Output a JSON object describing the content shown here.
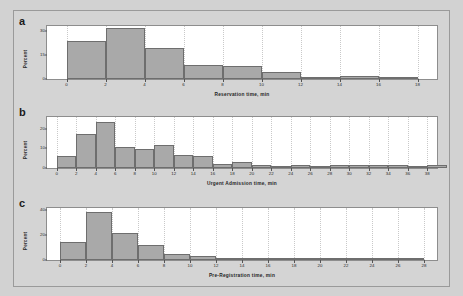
{
  "figure": {
    "background_color": "#d2d2d2",
    "panel_background": "#ffffff",
    "bar_fill_color": "#a9a9a9",
    "bar_edge_color": "#6e6e6e",
    "grid_color": "#c9c9c9"
  },
  "chart_data": [
    {
      "type": "bar",
      "panel_letter": "a",
      "title": "",
      "xlabel": "Reservation time, min",
      "ylabel": "Percent",
      "xlim": [
        -1,
        19
      ],
      "ylim": [
        0,
        33
      ],
      "xticks": [
        0,
        2,
        4,
        6,
        8,
        10,
        12,
        14,
        16,
        18
      ],
      "yticks": [
        0,
        15,
        30
      ],
      "grid": true,
      "legend": "none",
      "bin_width": 2,
      "bin_starts": [
        0,
        2,
        4,
        6,
        8,
        10,
        12,
        14,
        16
      ],
      "categories": [
        "0-2",
        "2-4",
        "4-6",
        "6-8",
        "8-10",
        "10-12",
        "12-14",
        "14-16",
        "16-18"
      ],
      "values": [
        23.5,
        31.5,
        19.5,
        8.5,
        8.0,
        4.5,
        0.0,
        2.0,
        0.0
      ]
    },
    {
      "type": "bar",
      "panel_letter": "b",
      "title": "",
      "xlabel": "Urgent Admission time, min",
      "ylabel": "Percent",
      "xlim": [
        -1,
        39
      ],
      "ylim": [
        0,
        26
      ],
      "xticks": [
        0,
        2,
        4,
        6,
        8,
        10,
        12,
        14,
        16,
        18,
        20,
        22,
        24,
        26,
        28,
        30,
        32,
        34,
        36,
        38
      ],
      "yticks": [
        0,
        10,
        20
      ],
      "grid": true,
      "legend": "none",
      "bin_width": 2,
      "bin_starts": [
        0,
        2,
        4,
        6,
        8,
        10,
        12,
        14,
        16,
        18,
        20,
        22,
        24,
        26,
        28,
        30,
        32,
        34,
        36,
        38
      ],
      "categories": [
        "0-2",
        "2-4",
        "4-6",
        "6-8",
        "8-10",
        "10-12",
        "12-14",
        "14-16",
        "16-18",
        "18-20",
        "20-22",
        "22-24",
        "24-26",
        "26-28",
        "28-30",
        "30-32",
        "32-34",
        "34-36",
        "36-38",
        "38-40"
      ],
      "values": [
        6.0,
        17.5,
        23.5,
        10.5,
        9.5,
        11.5,
        6.5,
        6.0,
        2.0,
        3.0,
        1.5,
        0.0,
        1.5,
        0.0,
        1.5,
        1.5,
        1.5,
        1.5,
        0.0,
        1.5
      ]
    },
    {
      "type": "bar",
      "panel_letter": "c",
      "title": "",
      "xlabel": "Pre-Registration time, min",
      "ylabel": "Percent",
      "xlim": [
        -1,
        29
      ],
      "ylim": [
        0,
        42
      ],
      "xticks": [
        0,
        2,
        4,
        6,
        8,
        10,
        12,
        14,
        16,
        18,
        20,
        22,
        24,
        26,
        28
      ],
      "yticks": [
        0,
        20,
        40
      ],
      "grid": true,
      "legend": "none",
      "bin_width": 2,
      "bin_starts": [
        0,
        2,
        4,
        6,
        8,
        10,
        12,
        14,
        16,
        18,
        20,
        22,
        24,
        26
      ],
      "categories": [
        "0-2",
        "2-4",
        "4-6",
        "6-8",
        "8-10",
        "10-12",
        "12-14",
        "14-16",
        "16-18",
        "18-20",
        "20-22",
        "22-24",
        "24-26",
        "26-28"
      ],
      "values": [
        14.5,
        38.5,
        21.5,
        12.0,
        4.5,
        3.0,
        1.5,
        1.5,
        0.0,
        0.0,
        0.0,
        0.0,
        0.0,
        1.0
      ]
    }
  ]
}
